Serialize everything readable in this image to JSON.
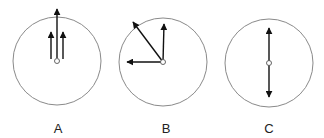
{
  "diagram": {
    "type": "vector-diagram",
    "colors": {
      "circle_stroke": "#8a8a8a",
      "arrow": "#111111",
      "center_dot_stroke": "#555555",
      "background": "#ffffff"
    },
    "panels": [
      {
        "label": "A",
        "description": "Three parallel vectors pointing up; middle one longest extending beyond circle",
        "circle": {
          "cx": 57,
          "cy": 61,
          "r": 44
        },
        "center": {
          "x": 57,
          "y": 61
        },
        "arrows": [
          {
            "x1": 57,
            "y1": 58,
            "x2": 57,
            "y2": 9
          },
          {
            "x1": 51,
            "y1": 59,
            "x2": 51,
            "y2": 32
          },
          {
            "x1": 63,
            "y1": 59,
            "x2": 63,
            "y2": 32
          }
        ],
        "label_pos": {
          "x": 58,
          "y": 122
        }
      },
      {
        "label": "B",
        "description": "Three vectors from center: up, left, and up-left diagonal",
        "circle": {
          "cx": 163,
          "cy": 62,
          "r": 44
        },
        "center": {
          "x": 163,
          "y": 62
        },
        "arrows": [
          {
            "x1": 163,
            "y1": 62,
            "x2": 164,
            "y2": 24
          },
          {
            "x1": 163,
            "y1": 62,
            "x2": 127,
            "y2": 62
          },
          {
            "x1": 163,
            "y1": 62,
            "x2": 133,
            "y2": 22
          }
        ],
        "label_pos": {
          "x": 166,
          "y": 122
        }
      },
      {
        "label": "C",
        "description": "Two opposite vectors from center: up and down",
        "circle": {
          "cx": 269,
          "cy": 63,
          "r": 44
        },
        "center": {
          "x": 269,
          "y": 63
        },
        "arrows": [
          {
            "x1": 269,
            "y1": 63,
            "x2": 269,
            "y2": 28
          },
          {
            "x1": 269,
            "y1": 63,
            "x2": 269,
            "y2": 97
          }
        ],
        "label_pos": {
          "x": 269,
          "y": 122
        }
      }
    ]
  }
}
